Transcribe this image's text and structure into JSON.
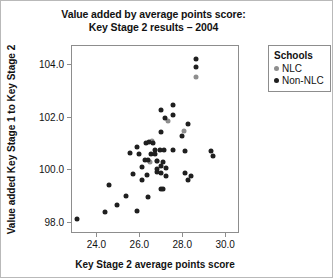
{
  "chart_data": {
    "type": "scatter",
    "title": "Value added by average points score:\nKey Stage 2 results – 2004",
    "xlabel": "Key Stage 2 average points score",
    "ylabel": "Value added Key Stage 1 to Key Stage 2",
    "xlim": [
      22.86,
      30.6
    ],
    "ylim": [
      97.6,
      104.7
    ],
    "xticks": [
      24.0,
      26.0,
      28.0,
      30.0
    ],
    "xtick_labels": [
      "24.0",
      "26.0",
      "28.0",
      "30.0"
    ],
    "yticks": [
      98.0,
      100.0,
      102.0,
      104.0
    ],
    "ytick_labels": [
      "98.0",
      "100.0",
      "102.0",
      "104.0"
    ],
    "grid": false,
    "legend_position": "right-outside",
    "legend_title": "Schools",
    "series": [
      {
        "name": "NLC",
        "color": "#8e8e8e",
        "points": [
          [
            28.66,
            103.52
          ],
          [
            27.35,
            101.82
          ],
          [
            26.61,
            101.06
          ],
          [
            26.82,
            100.32
          ],
          [
            26.48,
            100.28
          ],
          [
            28.07,
            101.45
          ]
        ]
      },
      {
        "name": "Non-NLC",
        "color": "#1f1f1f",
        "points": [
          [
            28.64,
            104.22
          ],
          [
            28.65,
            103.88
          ],
          [
            27.57,
            102.46
          ],
          [
            27.03,
            102.26
          ],
          [
            27.55,
            102.05
          ],
          [
            27.19,
            101.96
          ],
          [
            28.29,
            101.71
          ],
          [
            26.99,
            101.42
          ],
          [
            28.0,
            101.28
          ],
          [
            26.29,
            100.98
          ],
          [
            26.44,
            101.02
          ],
          [
            26.62,
            101.0
          ],
          [
            25.9,
            100.86
          ],
          [
            26.72,
            100.74
          ],
          [
            26.94,
            100.72
          ],
          [
            27.16,
            100.73
          ],
          [
            27.55,
            100.72
          ],
          [
            28.14,
            100.7
          ],
          [
            25.58,
            100.62
          ],
          [
            25.97,
            100.58
          ],
          [
            26.55,
            100.58
          ],
          [
            26.72,
            100.57
          ],
          [
            29.33,
            100.7
          ],
          [
            29.45,
            100.49
          ],
          [
            26.25,
            100.34
          ],
          [
            26.42,
            100.33
          ],
          [
            26.8,
            100.3
          ],
          [
            27.1,
            100.28
          ],
          [
            26.13,
            100.1
          ],
          [
            27.03,
            100.12
          ],
          [
            27.25,
            100.06
          ],
          [
            26.8,
            100.0
          ],
          [
            26.8,
            99.88
          ],
          [
            27.02,
            99.86
          ],
          [
            25.7,
            99.82
          ],
          [
            26.35,
            99.76
          ],
          [
            27.23,
            99.74
          ],
          [
            28.15,
            99.86
          ],
          [
            28.4,
            99.72
          ],
          [
            28.26,
            99.6
          ],
          [
            26.12,
            99.58
          ],
          [
            24.6,
            99.4
          ],
          [
            26.99,
            99.25
          ],
          [
            27.1,
            99.25
          ],
          [
            25.4,
            98.96
          ],
          [
            26.42,
            98.92
          ],
          [
            24.96,
            98.62
          ],
          [
            25.88,
            98.42
          ],
          [
            23.1,
            98.1
          ],
          [
            24.42,
            98.36
          ]
        ]
      }
    ]
  }
}
